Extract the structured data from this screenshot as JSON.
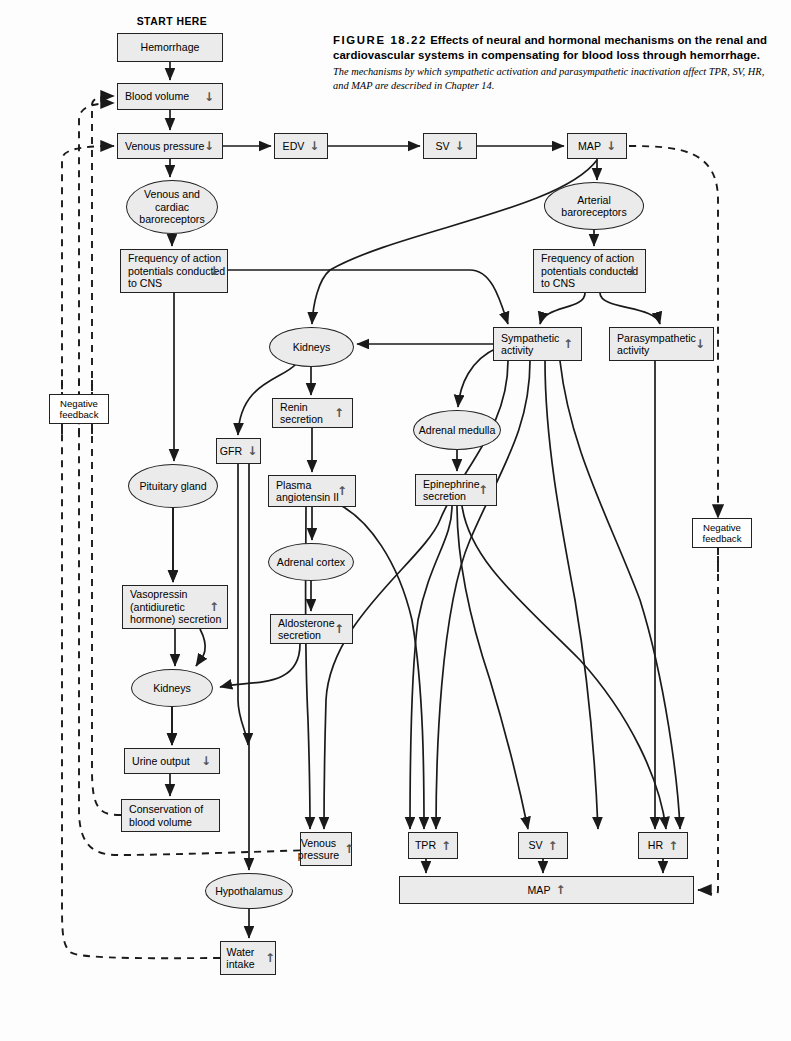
{
  "figure": {
    "number_label": "FIGURE 18.22",
    "title": "Effects of neural and hormonal mechanisms on the renal and cardiovascular systems in compensating for blood loss through hemorrhage.",
    "subtitle": "The mechanisms by which sympathetic activation and parasympathetic inactivation affect TPR, SV, HR, and MAP are described in Chapter 14."
  },
  "start_label": "START HERE",
  "colors": {
    "node_fill": "#ebebeb",
    "node_stroke": "#222222",
    "line": "#1a1a1a",
    "arrow_glyph": "#555555",
    "page_bg": "#fdfdfd"
  },
  "arrows": {
    "down": "↓",
    "up": "↑"
  },
  "nodes": [
    {
      "id": "hemorrhage",
      "shape": "rect",
      "label": "Hemorrhage",
      "change": "",
      "x": 117,
      "y": 33,
      "w": 106,
      "h": 29
    },
    {
      "id": "blood-volume",
      "shape": "rect",
      "label": "Blood volume",
      "change": "down",
      "x": 117,
      "y": 83,
      "w": 106,
      "h": 27
    },
    {
      "id": "venous-pressure",
      "shape": "rect",
      "label": "Venous pressure",
      "change": "down",
      "x": 117,
      "y": 133,
      "w": 106,
      "h": 26
    },
    {
      "id": "edv",
      "shape": "rect",
      "label": "EDV",
      "change": "down",
      "x": 274,
      "y": 133,
      "w": 54,
      "h": 26
    },
    {
      "id": "sv-down",
      "shape": "rect",
      "label": "SV",
      "change": "down",
      "x": 423,
      "y": 133,
      "w": 54,
      "h": 26
    },
    {
      "id": "map-down",
      "shape": "rect",
      "label": "MAP",
      "change": "down",
      "x": 567,
      "y": 133,
      "w": 60,
      "h": 26
    },
    {
      "id": "venous-cardiac-baroreceptors",
      "shape": "oval",
      "label": "Venous and cardiac baroreceptors",
      "change": "",
      "x": 126,
      "y": 180,
      "w": 92,
      "h": 54
    },
    {
      "id": "arterial-baroreceptors",
      "shape": "oval",
      "label": "Arterial baroreceptors",
      "change": "",
      "x": 544,
      "y": 182,
      "w": 100,
      "h": 48
    },
    {
      "id": "frequency-ap-left",
      "shape": "rect",
      "label": "Frequency of action potentials conducted to CNS",
      "change": "down",
      "x": 120,
      "y": 249,
      "w": 108,
      "h": 44
    },
    {
      "id": "frequency-ap-right",
      "shape": "rect",
      "label": "Frequency of action potentials conducted to CNS",
      "change": "down",
      "x": 533,
      "y": 249,
      "w": 113,
      "h": 44
    },
    {
      "id": "kidneys-upper",
      "shape": "oval",
      "label": "Kidneys",
      "change": "",
      "x": 269,
      "y": 327,
      "w": 85,
      "h": 40
    },
    {
      "id": "sympathetic-activity",
      "shape": "rect",
      "label": "Sympathetic activity",
      "change": "up",
      "x": 493,
      "y": 327,
      "w": 89,
      "h": 34
    },
    {
      "id": "parasympathetic-activity",
      "shape": "rect",
      "label": "Parasympathetic activity",
      "change": "down",
      "x": 609,
      "y": 327,
      "w": 105,
      "h": 34
    },
    {
      "id": "renin-secretion",
      "shape": "rect",
      "label": "Renin secretion",
      "change": "up",
      "x": 272,
      "y": 398,
      "w": 81,
      "h": 30
    },
    {
      "id": "adrenal-medulla",
      "shape": "oval",
      "label": "Adrenal medulla",
      "change": "",
      "x": 413,
      "y": 410,
      "w": 88,
      "h": 40
    },
    {
      "id": "gfr",
      "shape": "rect",
      "label": "GFR",
      "change": "down",
      "x": 216,
      "y": 438,
      "w": 45,
      "h": 26
    },
    {
      "id": "pituitary-gland",
      "shape": "oval",
      "label": "Pituitary gland",
      "change": "",
      "x": 128,
      "y": 464,
      "w": 90,
      "h": 44
    },
    {
      "id": "plasma-angiotensin-ii",
      "shape": "rect",
      "label": "Plasma angiotensin II",
      "change": "up",
      "x": 268,
      "y": 475,
      "w": 88,
      "h": 32
    },
    {
      "id": "epinephrine-secretion",
      "shape": "rect",
      "label": "Epinephrine secretion",
      "change": "up",
      "x": 415,
      "y": 474,
      "w": 82,
      "h": 32
    },
    {
      "id": "adrenal-cortex",
      "shape": "oval",
      "label": "Adrenal cortex",
      "change": "",
      "x": 268,
      "y": 543,
      "w": 86,
      "h": 38
    },
    {
      "id": "vasopressin",
      "shape": "rect",
      "label": "Vasopressin (antidiuretic hormone) secretion",
      "change": "up",
      "x": 122,
      "y": 585,
      "w": 106,
      "h": 44
    },
    {
      "id": "aldosterone-secretion",
      "shape": "rect",
      "label": "Aldosterone secretion",
      "change": "up",
      "x": 270,
      "y": 614,
      "w": 83,
      "h": 30
    },
    {
      "id": "kidneys-lower",
      "shape": "oval",
      "label": "Kidneys",
      "change": "",
      "x": 131,
      "y": 669,
      "w": 82,
      "h": 38
    },
    {
      "id": "urine-output",
      "shape": "rect",
      "label": "Urine output",
      "change": "down",
      "x": 124,
      "y": 748,
      "w": 96,
      "h": 26
    },
    {
      "id": "conservation-blood-volume",
      "shape": "rect",
      "label": "Conservation of blood volume",
      "change": "",
      "x": 121,
      "y": 799,
      "w": 99,
      "h": 33
    },
    {
      "id": "venous-pressure-up",
      "shape": "rect",
      "label": "Venous pressure",
      "change": "up",
      "x": 300,
      "y": 832,
      "w": 52,
      "h": 34
    },
    {
      "id": "tpr-up",
      "shape": "rect",
      "label": "TPR",
      "change": "up",
      "x": 408,
      "y": 832,
      "w": 50,
      "h": 27
    },
    {
      "id": "sv-up",
      "shape": "rect",
      "label": "SV",
      "change": "up",
      "x": 518,
      "y": 832,
      "w": 50,
      "h": 27
    },
    {
      "id": "hr-up",
      "shape": "rect",
      "label": "HR",
      "change": "up",
      "x": 638,
      "y": 832,
      "w": 50,
      "h": 27
    },
    {
      "id": "map-up",
      "shape": "rect",
      "label": "MAP",
      "change": "up",
      "x": 399,
      "y": 876,
      "w": 295,
      "h": 28
    },
    {
      "id": "hypothalamus",
      "shape": "oval",
      "label": "Hypothalamus",
      "change": "",
      "x": 205,
      "y": 873,
      "w": 88,
      "h": 36
    },
    {
      "id": "water-intake",
      "shape": "rect",
      "label": "Water intake",
      "change": "up",
      "x": 220,
      "y": 941,
      "w": 56,
      "h": 34
    }
  ],
  "feedback_boxes": [
    {
      "id": "negative-feedback-left",
      "label": "Negative feedback",
      "x": 49,
      "y": 394,
      "w": 60,
      "h": 30
    },
    {
      "id": "negative-feedback-right",
      "label": "Negative feedback",
      "x": 692,
      "y": 518,
      "w": 60,
      "h": 30
    }
  ],
  "diagram_meta": {
    "type": "flowchart",
    "box_shapes": [
      "rect",
      "oval"
    ],
    "edge_styles": [
      "solid-arrow",
      "dashed-arrow"
    ],
    "dashed_edges_meaning": "negative feedback"
  }
}
